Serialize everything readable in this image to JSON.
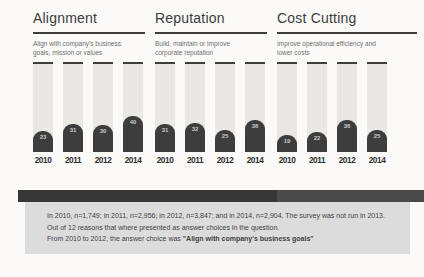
{
  "sections": [
    {
      "title": "Alignment",
      "subtitle": "Align with company's business goals, mission or values",
      "years": [
        "2010",
        "2011",
        "2012",
        "2014"
      ],
      "values": [
        23,
        31,
        30,
        40
      ]
    },
    {
      "title": "Reputation",
      "subtitle": "Build, maintain or improve corporate reputation",
      "years": [
        "2010",
        "2011",
        "2012",
        "2014"
      ],
      "values": [
        31,
        32,
        25,
        36
      ]
    },
    {
      "title": "Cost Cutting",
      "subtitle": "Improve operational efficiency and lower costs",
      "years": [
        "2010",
        "2011",
        "2012",
        "2014"
      ],
      "values": [
        19,
        22,
        36,
        25
      ]
    }
  ],
  "footnote": {
    "line1": "In 2010, n=1,749; in 2011, n=2,956; in 2012, n=3,847; and in 2014, n=2,904. The survey was not run in 2013.",
    "line2": "Out of 12 reasons that where presented as answer choices in the question.",
    "line3_prefix": "From 2010 to 2012, the answer choice was ",
    "line3_bold": "\"Align with company's business goals\""
  },
  "colors": {
    "canvas_bg": "#fbfaf8",
    "accent_dark": "#3d3d3d",
    "track_bg": "#e9e8e4",
    "title_text": "#3c3c3c",
    "subtitle_text": "#6f6f6f",
    "year_text": "#2e2e2e",
    "value_text": "#c9c9c9",
    "ribbon_left": "#373737",
    "ribbon_right": "#4a4a4a",
    "panel_bg": "#dcdcdc",
    "panel_text": "#3f3f3f"
  },
  "chart_data": [
    {
      "type": "bar",
      "title": "Alignment",
      "subtitle": "Align with company's business goals, mission or values",
      "categories": [
        "2010",
        "2011",
        "2012",
        "2014"
      ],
      "values": [
        23,
        31,
        30,
        40
      ],
      "xlabel": "",
      "ylabel": "",
      "ylim": [
        0,
        100
      ],
      "grid": false,
      "legend": "none",
      "note": "dark fill on full-height light track, value label inside fill"
    },
    {
      "type": "bar",
      "title": "Reputation",
      "subtitle": "Build, maintain or improve corporate reputation",
      "categories": [
        "2010",
        "2011",
        "2012",
        "2014"
      ],
      "values": [
        31,
        32,
        25,
        36
      ],
      "xlabel": "",
      "ylabel": "",
      "ylim": [
        0,
        100
      ],
      "grid": false,
      "legend": "none"
    },
    {
      "type": "bar",
      "title": "Cost Cutting",
      "subtitle": "Improve operational efficiency and lower costs",
      "categories": [
        "2010",
        "2011",
        "2012",
        "2014"
      ],
      "values": [
        19,
        22,
        36,
        25
      ],
      "xlabel": "",
      "ylabel": "",
      "ylim": [
        0,
        100
      ],
      "grid": false,
      "legend": "none"
    }
  ]
}
